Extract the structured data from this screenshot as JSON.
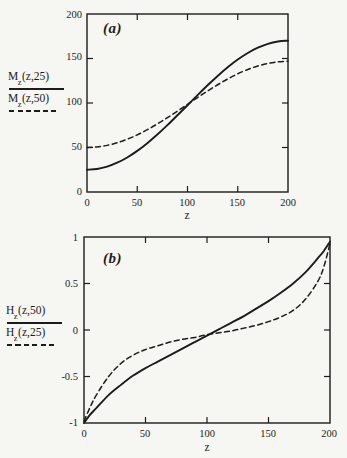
{
  "figure": {
    "paper_color": "#f6f6f2",
    "ink_color": "#1c1c1c"
  },
  "panels": [
    {
      "tag": "(a)",
      "x_label": "z",
      "x_tick_labels": [
        "0",
        "50",
        "100",
        "150",
        "200"
      ],
      "y_tick_labels": [
        "200",
        "150",
        "100",
        "50",
        "0"
      ],
      "legend": [
        {
          "base": "M",
          "sub": "z",
          "args": "(z,25)",
          "line": "solid"
        },
        {
          "base": "M",
          "sub": "z",
          "args": "(z,50)",
          "line": "dashed"
        }
      ]
    },
    {
      "tag": "(b)",
      "x_label": "z",
      "x_tick_labels": [
        "0",
        "50",
        "100",
        "150",
        "200"
      ],
      "y_tick_labels": [
        "1",
        "0.5",
        "0",
        "-0.5",
        "-1"
      ],
      "legend": [
        {
          "base": "H",
          "sub": "z",
          "args": "(z,50)",
          "line": "solid"
        },
        {
          "base": "H",
          "sub": "z",
          "args": "(z,25)",
          "line": "dashed"
        }
      ]
    }
  ],
  "chart_data": [
    {
      "type": "line",
      "panel": "a",
      "title": "(a)",
      "xlabel": "z",
      "ylabel": "",
      "xlim": [
        0,
        200
      ],
      "ylim": [
        0,
        200
      ],
      "x_ticks": [
        0,
        50,
        100,
        150,
        200
      ],
      "y_ticks": [
        0,
        50,
        100,
        150,
        200
      ],
      "grid": false,
      "legend_position": "left-outside",
      "series": [
        {
          "name": "M_z(z,25)",
          "line": "solid",
          "x": [
            0,
            10,
            20,
            30,
            40,
            50,
            60,
            70,
            80,
            90,
            100,
            110,
            120,
            130,
            140,
            150,
            160,
            170,
            180,
            190,
            200
          ],
          "y": [
            25,
            25.9,
            28.5,
            32.9,
            38.8,
            46.2,
            54.9,
            64.6,
            75.1,
            86.2,
            97.5,
            108.8,
            119.9,
            130.4,
            140.1,
            148.8,
            156.2,
            162.1,
            166.5,
            169.1,
            170
          ]
        },
        {
          "name": "M_z(z,50)",
          "line": "dashed",
          "x": [
            0,
            10,
            20,
            30,
            40,
            50,
            60,
            70,
            80,
            90,
            100,
            110,
            120,
            130,
            140,
            150,
            160,
            170,
            180,
            190,
            200
          ],
          "y": [
            50,
            50.6,
            52.4,
            55.3,
            59.3,
            64.2,
            70,
            76.5,
            83.5,
            90.9,
            98.5,
            106.1,
            113.5,
            120.5,
            127,
            132.8,
            137.7,
            141.6,
            144.4,
            146.2,
            147
          ]
        }
      ]
    },
    {
      "type": "line",
      "panel": "b",
      "title": "(b)",
      "xlabel": "z",
      "ylabel": "",
      "xlim": [
        0,
        200
      ],
      "ylim": [
        -1,
        1
      ],
      "x_ticks": [
        0,
        50,
        100,
        150,
        200
      ],
      "y_ticks": [
        -1,
        -0.5,
        0,
        0.5,
        1
      ],
      "grid": false,
      "legend_position": "left-outside",
      "series": [
        {
          "name": "H_z(z,50)",
          "line": "solid",
          "x": [
            0,
            5,
            10,
            20,
            30,
            40,
            50,
            60,
            70,
            80,
            90,
            100,
            110,
            120,
            130,
            140,
            150,
            160,
            170,
            180,
            190,
            195,
            200
          ],
          "y": [
            -1,
            -0.91,
            -0.84,
            -0.7,
            -0.59,
            -0.49,
            -0.41,
            -0.34,
            -0.27,
            -0.2,
            -0.13,
            -0.06,
            0.01,
            0.08,
            0.15,
            0.23,
            0.31,
            0.4,
            0.5,
            0.62,
            0.77,
            0.85,
            0.95
          ]
        },
        {
          "name": "H_z(z,25)",
          "line": "dashed",
          "x": [
            0,
            5,
            10,
            20,
            30,
            40,
            50,
            60,
            70,
            80,
            90,
            100,
            110,
            120,
            130,
            140,
            150,
            160,
            170,
            180,
            190,
            195,
            200
          ],
          "y": [
            -0.98,
            -0.83,
            -0.7,
            -0.5,
            -0.36,
            -0.27,
            -0.21,
            -0.17,
            -0.13,
            -0.1,
            -0.08,
            -0.05,
            -0.03,
            -0.01,
            0.02,
            0.05,
            0.09,
            0.14,
            0.21,
            0.33,
            0.52,
            0.68,
            0.93
          ]
        }
      ]
    }
  ]
}
